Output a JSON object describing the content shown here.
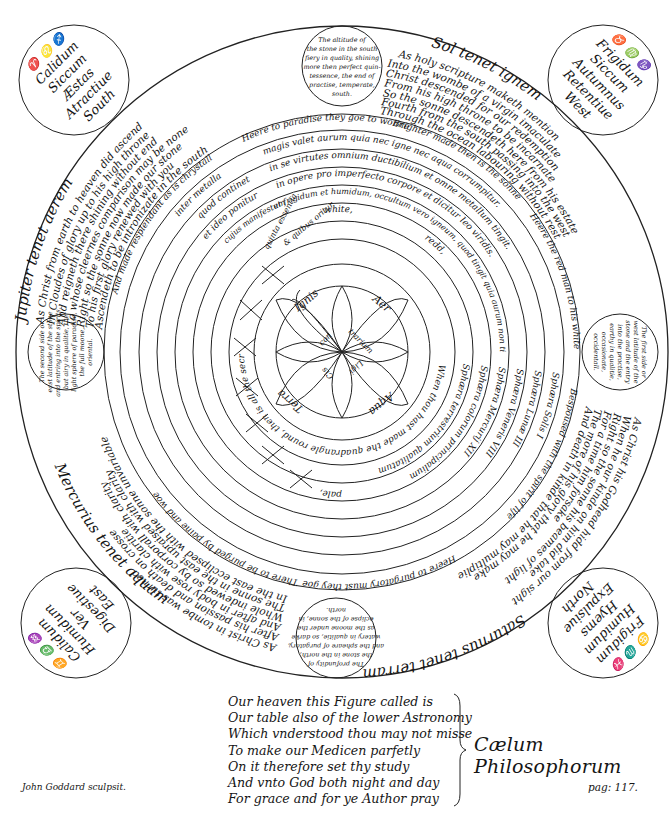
{
  "figure": {
    "title": "Cælum Philosophorum",
    "engraver": "John Goddard sculpsit.",
    "page": "pag: 117."
  },
  "outer_ring": {
    "sol": "Sol tenet ignem",
    "jupiter": "Jupiter tenet aerem",
    "saturnus": "Saturnus tenet terram",
    "mercurius": "Mercurius tenet aquam"
  },
  "corners": {
    "top_left": {
      "signs": "♈ ♌ ♐",
      "lines": [
        "Calidum",
        "Siccum",
        "Æstas",
        "Atractiue",
        "South"
      ]
    },
    "top_right": {
      "signs": "♉ ♍ ♑",
      "lines": [
        "Frigidum",
        "Siccum",
        "Autumnus",
        "Retentiue",
        "West"
      ]
    },
    "bottom_left": {
      "signs": "♊ ♎ ♒",
      "lines": [
        "Calidum",
        "Humidum",
        "Ver",
        "Digestiue",
        "East"
      ]
    },
    "bottom_right": {
      "signs": "♋ ♏ ♓",
      "lines": [
        "Frigidum",
        "Humidum",
        "Hyems",
        "Expulsiue",
        "North"
      ]
    }
  },
  "medallions": {
    "top": [
      "The altitude of",
      "the stone in the south",
      "fiery in quality, shining",
      "more then perfect quin-",
      "tessence, the end of",
      "practise, temperate,",
      "south."
    ],
    "left": [
      "The second side or",
      "east latitude of the stone",
      "and entring into the spirits,",
      "but airy in qualitie, the",
      "light sphere of paradise,",
      "the full moone,",
      "oriental."
    ],
    "right": [
      "The first side or",
      "west latitude of the",
      "stone and the entry",
      "into the practise,",
      "earthy in qualitie,",
      "occasionate,",
      "occidentall."
    ],
    "bottom": [
      "The profundity of",
      "the stone in the north,",
      "and the spheare of purgatory,",
      "watery in qualitie, so darke",
      "as the moone under the",
      "eclipse of the sonne, in",
      "north."
    ]
  },
  "verse_bands": {
    "upper_left": [
      "As Christ from earth to heaven did ascend",
      "In Cloudes of glory up to his high throne",
      "And reigneth there shining without end",
      "To whose cleernes comparison may be none",
      "Right so the sonne now made our stone",
      "To his first glory renewed with you",
      "Ascendeth to be intronizate in the south"
    ],
    "upper_right": [
      "As holy scripture maketh mention",
      "Into the wombe of a virgin imaculate",
      "Christ descended for our redemption",
      "From his high throne to be incarnate",
      "So the sonne descendeth here from his estate",
      "Fourth from the south passing into the west",
      "Through the ocean labouring without rest"
    ],
    "lower_right": [
      "As Christ his Godhead hidd from our sight",
      "When he our kinde on him did take",
      "Right so the sonne his beames of light",
      "For a time him forsake",
      "The more of his glory that he may make",
      "And death in kinde that he may multiplie"
    ],
    "lower_left": [
      "As Christ in tombe was turned",
      "After his passion and death on crosse",
      "And after in body rose with claritie",
      "Whole indewed so by corporall with clarity",
      "The sonne in the east upraised with clarity",
      "In the east ecclipsed with the sonne unvariable"
    ]
  },
  "rings": [
    {
      "top": "Heere to paradise they goe to wonne",
      "top2": "Brighter made then is the sonne",
      "right": "Heere the red man to his white wife",
      "right2": "Bespoused with the spirit of life",
      "bottom": "Heere to purgatory must they goe",
      "bottom2": "There to be purged by paine and woe",
      "left": "And made resplendant as is chrystall"
    },
    {
      "text": "magis valet aurum quia nec igne nec aqua corrumpitur.",
      "left": "inter metalla"
    },
    {
      "text": "in se virtutes omnium ductibilium et omne metallum tingit.",
      "left": "quod continet"
    },
    {
      "text": "in opere pro imperfecto corpore et dicitur leo viridis.",
      "left": "et ideo ponitur"
    },
    {
      "text": "et frigidum et humidum, occultum vero igneum, quod tingit quia aurum non tingit, blande.",
      "left": "cujus manifestum"
    },
    {
      "text": "white,",
      "text2": "redd,",
      "text3": "pale,"
    }
  ],
  "inner_ring_text": "When thou hast made the quadrangle round, then is all the secret found.",
  "inner_labels": {
    "quinta": "quinta essentia",
    "quibus": "& quibus oritur"
  },
  "spheres": [
    "Sphæra Solis I",
    "Sphæra Lunæ III",
    "Sphæra Veneris VIII",
    "Sphæra Mercurij XII",
    "Sphæra colorum principalium",
    "Sphæra terrestrium qualitatum"
  ],
  "elements": {
    "ignis": "Ignis",
    "aer": "Aer",
    "terra": "Terra",
    "aqua": "Aqua",
    "center": [
      "con",
      "trarium",
      "Cis",
      "Ligi"
    ]
  },
  "element_cross_labels": [
    [
      "ignis",
      "fit",
      "aqua"
    ],
    [
      "aer",
      "fit",
      "terra"
    ],
    [
      "ignis",
      "fit",
      "terra"
    ],
    [
      "aer",
      "fit",
      "aqua"
    ],
    [
      "terra",
      "fit",
      "ignis"
    ],
    [
      "aqua",
      "fit",
      "aer"
    ]
  ],
  "verse": {
    "lines": [
      "Our heaven this Figure called is",
      "Our table also of the lower Astronomy",
      "Which vnderstood thou may not misse",
      "To make our Medicen parfetly",
      "On it therefore set thy study",
      "And vnto God both night and day",
      "For grace and for ye Author pray"
    ]
  }
}
